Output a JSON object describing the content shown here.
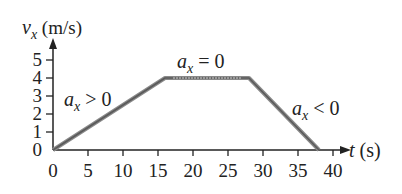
{
  "chart_data": {
    "type": "line",
    "title": "",
    "xlabel": "t (s)",
    "ylabel": "v_x (m/s)",
    "xlim": [
      0,
      40
    ],
    "ylim": [
      0,
      5
    ],
    "grid": false,
    "x_ticks": [
      0,
      5,
      10,
      15,
      20,
      25,
      30,
      35,
      40
    ],
    "y_ticks": [
      0,
      1,
      2,
      3,
      4,
      5
    ],
    "series": [
      {
        "name": "v_x",
        "points": [
          [
            0,
            0
          ],
          [
            16,
            4
          ],
          [
            28,
            4
          ],
          [
            38,
            0
          ]
        ]
      }
    ],
    "annotations": [
      {
        "text": "a_x > 0",
        "x": 5,
        "y": 2.8
      },
      {
        "text": "a_x = 0",
        "x": 22,
        "y": 4.7
      },
      {
        "text": "a_x < 0",
        "x": 36,
        "y": 2.1
      }
    ]
  },
  "labels": {
    "y_axis_var": "v",
    "y_axis_sub": "x",
    "y_axis_unit": " (m/s)",
    "x_axis_var": "t",
    "x_axis_unit": " (s)",
    "ann1_var": "a",
    "ann1_sub": "x",
    "ann1_rel": " > 0",
    "ann2_var": "a",
    "ann2_sub": "x",
    "ann2_rel": " = 0",
    "ann3_var": "a",
    "ann3_sub": "x",
    "ann3_rel": " < 0"
  }
}
